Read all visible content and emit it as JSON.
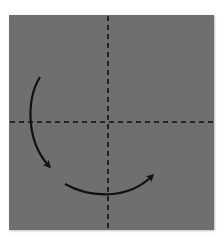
{
  "diagram": {
    "type": "origami-fold-step",
    "paper": {
      "color": "#6f6f6f",
      "shape": "square"
    },
    "crease_lines": [
      {
        "name": "vertical-center-crease",
        "style": "dashed",
        "color": "#111111"
      },
      {
        "name": "horizontal-center-crease",
        "style": "dashed",
        "color": "#111111"
      }
    ],
    "arrows": [
      {
        "name": "fold-arrow-left",
        "direction": "curving-down",
        "color": "#111111"
      },
      {
        "name": "fold-arrow-bottom",
        "direction": "curving-right-up",
        "color": "#111111"
      }
    ]
  }
}
